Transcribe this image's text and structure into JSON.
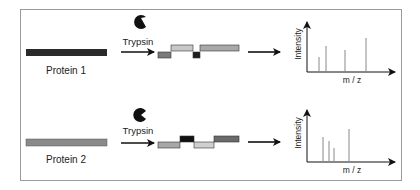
{
  "diagram": {
    "rows": [
      {
        "protein_label": "Protein 1",
        "protein_bar_color": "#2a2a2a",
        "enzyme_label": "Trypsin",
        "enzyme_icon": "pacman-icon",
        "peptides": [
          {
            "color": "#7a7a7a",
            "level": "low"
          },
          {
            "color": "#c8c8c8",
            "level": "high"
          },
          {
            "color": "#1e1e1e",
            "level": "low"
          },
          {
            "color": "#a8a8a8",
            "level": "high"
          }
        ],
        "spectrum": {
          "ylabel": "Intensity",
          "xlabel": "m / z",
          "peaks": [
            {
              "x": 0.25,
              "h": 0.4
            },
            {
              "x": 0.38,
              "h": 0.62
            },
            {
              "x": 0.73,
              "h": 0.52
            },
            {
              "x": 1.0,
              "h": 0.85
            }
          ]
        }
      },
      {
        "protein_label": "Protein 2",
        "protein_bar_color": "#8a8a8a",
        "enzyme_label": "Trypsin",
        "enzyme_icon": "pacman-icon",
        "peptides": [
          {
            "color": "#a8a8a8",
            "level": "low"
          },
          {
            "color": "#111111",
            "level": "high"
          },
          {
            "color": "#cfcfcf",
            "level": "low"
          },
          {
            "color": "#6a6a6a",
            "level": "high"
          }
        ],
        "spectrum": {
          "ylabel": "Intensity",
          "xlabel": "m / z",
          "peaks": [
            {
              "x": 0.3,
              "h": 0.62
            },
            {
              "x": 0.42,
              "h": 0.55
            },
            {
              "x": 0.52,
              "h": 0.4
            },
            {
              "x": 0.78,
              "h": 0.78
            }
          ]
        }
      }
    ]
  }
}
